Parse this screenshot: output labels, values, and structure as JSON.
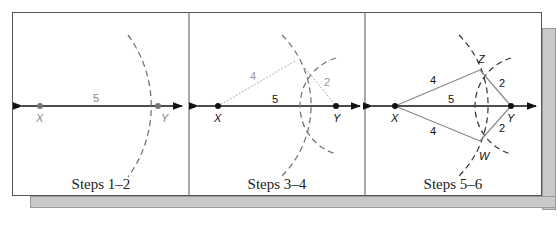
{
  "figure": {
    "panels": [
      {
        "caption": "Steps 1–2",
        "points": {
          "X": "X",
          "Y": "Y"
        },
        "segment_labels": {
          "XY": "5"
        }
      },
      {
        "caption": "Steps 3–4",
        "points": {
          "X": "X",
          "Y": "Y"
        },
        "segment_labels": {
          "XY": "5",
          "XZ": "4",
          "YZ": "2"
        }
      },
      {
        "caption": "Steps 5–6",
        "points": {
          "X": "X",
          "Y": "Y",
          "Z": "Z",
          "W": "W"
        },
        "segment_labels": {
          "XY": "5",
          "XZ": "4",
          "YZ": "2",
          "XW": "4",
          "YW": "2"
        }
      }
    ],
    "colors": {
      "ink": "#111111",
      "gray": "#8a8a8a",
      "shadow": "#c9c9c9"
    }
  }
}
